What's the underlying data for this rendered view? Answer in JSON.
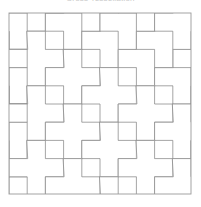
{
  "page": {
    "background_color": "#ffffff",
    "width": 201,
    "height": 207
  },
  "title": {
    "text": "Cross Tessellation",
    "color": "#c9c9c9",
    "note": "clipped at top edge of image, only lower pixels visible"
  },
  "artwork": {
    "name": "Greek cross tessellation pattern",
    "description": "Plus/cross shaped tiles tessellating a square frame",
    "frame": {
      "x": 9,
      "y": 13,
      "width": 182,
      "height": 181,
      "stroke_color": "#9a9a9a",
      "stroke_width": 0.8,
      "fill_color": "#ffffff"
    },
    "grid": {
      "columns": 10,
      "rows": 10,
      "unit_px": 18.2,
      "visible": false
    },
    "tile": {
      "shape": "plus",
      "arm_units": 1,
      "stroke_color": "#8e8e8e",
      "stroke_width": 0.8,
      "fill_color": "#ffffff"
    },
    "lattice": {
      "vector_a": [
        2,
        1
      ],
      "vector_b": [
        1,
        -2
      ],
      "origin_center": [
        2,
        1
      ]
    },
    "cross_centers": [
      [
        2,
        1
      ],
      [
        4,
        2
      ],
      [
        6,
        3
      ],
      [
        8,
        4
      ],
      [
        10,
        5
      ],
      [
        0,
        0
      ],
      [
        1,
        -1
      ],
      [
        3,
        0
      ],
      [
        5,
        1
      ],
      [
        7,
        2
      ],
      [
        9,
        3
      ],
      [
        0,
        3
      ],
      [
        2,
        4
      ],
      [
        4,
        5
      ],
      [
        6,
        6
      ],
      [
        8,
        7
      ],
      [
        10,
        8
      ],
      [
        1,
        2
      ],
      [
        3,
        3
      ],
      [
        5,
        4
      ],
      [
        7,
        5
      ],
      [
        9,
        6
      ],
      [
        0,
        6
      ],
      [
        2,
        7
      ],
      [
        4,
        8
      ],
      [
        6,
        9
      ],
      [
        8,
        10
      ],
      [
        1,
        5
      ],
      [
        3,
        6
      ],
      [
        5,
        7
      ],
      [
        7,
        8
      ],
      [
        9,
        9
      ],
      [
        0,
        9
      ],
      [
        2,
        10
      ],
      [
        -1,
        2
      ],
      [
        -1,
        5
      ],
      [
        -1,
        8
      ],
      [
        1,
        8
      ],
      [
        3,
        9
      ],
      [
        5,
        10
      ],
      [
        11,
        1
      ],
      [
        11,
        4
      ],
      [
        11,
        7
      ],
      [
        10,
        2
      ],
      [
        4,
        -1
      ],
      [
        6,
        0
      ],
      [
        8,
        1
      ],
      [
        10,
        -1
      ],
      [
        2,
        -2
      ],
      [
        0,
        -3
      ],
      [
        7,
        -1
      ],
      [
        9,
        0
      ],
      [
        11,
        10
      ],
      [
        3,
        -3
      ],
      [
        4,
        11
      ],
      [
        6,
        12
      ],
      [
        8,
        13
      ],
      [
        -2,
        4
      ],
      [
        12,
        3
      ],
      [
        12,
        6
      ],
      [
        12,
        9
      ]
    ]
  }
}
